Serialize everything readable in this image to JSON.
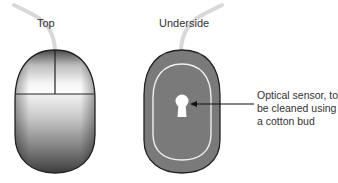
{
  "diagram": {
    "views": [
      {
        "id": "top",
        "label": "Top"
      },
      {
        "id": "underside",
        "label": "Underside"
      }
    ],
    "callout": {
      "lines": [
        "Optical sensor, to",
        "be cleaned using",
        "a cotton bud"
      ],
      "target": "optical-sensor"
    },
    "colors": {
      "cable": "#d8d8d8",
      "outline": "#222222",
      "underside_fill": "#7a7a7a",
      "underside_ring": "#f0f0f0",
      "sensor": "#ffffff",
      "arrow": "#111111",
      "text": "#333333"
    }
  }
}
